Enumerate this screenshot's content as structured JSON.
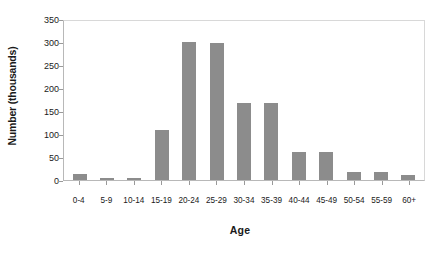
{
  "chart_data": {
    "type": "bar",
    "title": "",
    "xlabel": "Age",
    "ylabel": "Number (thousands)",
    "categories": [
      "0-4",
      "5-9",
      "10-14",
      "15-19",
      "20-24",
      "25-29",
      "30-34",
      "35-39",
      "40-44",
      "45-49",
      "50-54",
      "55-59",
      "60+"
    ],
    "values": [
      14,
      4,
      4,
      111,
      303,
      302,
      169,
      169,
      61,
      61,
      18,
      18,
      11
    ],
    "ylim": [
      0,
      350
    ],
    "yticks": [
      0,
      50,
      100,
      150,
      200,
      250,
      300,
      350
    ],
    "ytick_labels": [
      "0",
      "50",
      "100",
      "150",
      "200",
      "250",
      "300",
      "350"
    ],
    "grid": false,
    "legend": null,
    "bar_color": "#8c8c8c",
    "plot_border_color": "#c0c0c0",
    "background_color": "#ffffff"
  }
}
